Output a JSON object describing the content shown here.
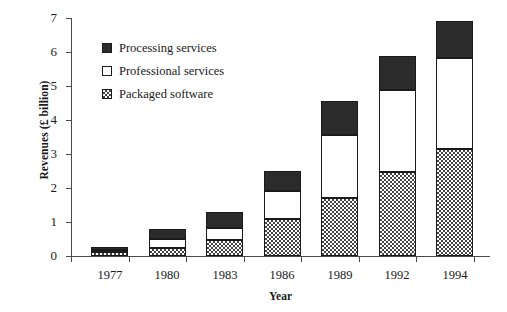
{
  "chart_data": {
    "type": "bar",
    "subtype": "stacked-bar",
    "title": "",
    "xlabel": "Year",
    "ylabel": "Revenues (£ billion)",
    "categories": [
      "1977",
      "1980",
      "1983",
      "1986",
      "1989",
      "1992",
      "1994"
    ],
    "ylim": [
      0,
      7
    ],
    "yticks": [
      "0",
      "1",
      "2",
      "3",
      "4",
      "5",
      "6",
      "7"
    ],
    "grid": false,
    "legend_position": "upper-left-inside",
    "series": [
      {
        "name": "Packaged software",
        "swatch": "checkered-gray",
        "color": "#454545",
        "values": [
          0.12,
          0.25,
          0.47,
          1.1,
          1.72,
          2.47,
          3.15
        ]
      },
      {
        "name": "Professional services",
        "swatch": "white",
        "color": "#ffffff",
        "values": [
          0.06,
          0.25,
          0.35,
          0.82,
          1.85,
          2.42,
          2.67
        ]
      },
      {
        "name": "Processing services",
        "swatch": "solid-black",
        "color": "#2b2b2b",
        "values": [
          0.1,
          0.3,
          0.48,
          0.58,
          0.98,
          1.0,
          1.08
        ]
      }
    ],
    "totals": [
      0.28,
      0.8,
      1.3,
      2.5,
      4.55,
      5.89,
      6.9
    ]
  },
  "legend": {
    "entries": [
      {
        "label": "Processing services"
      },
      {
        "label": "Professional services"
      },
      {
        "label": "Packaged software"
      }
    ]
  },
  "axes": {
    "y_title": "Revenues (£ billion)",
    "x_title": "Year"
  }
}
